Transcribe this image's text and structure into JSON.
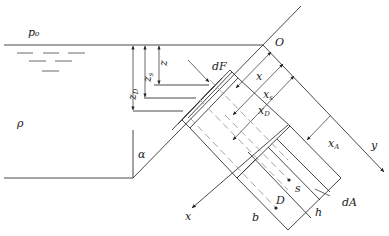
{
  "diagram": {
    "labels": {
      "p0": "p₀",
      "rho": "ρ",
      "alpha": "α",
      "origin": "O",
      "dF": "dF",
      "z": "z",
      "zs": "z",
      "zs_sub": "s",
      "zD": "z",
      "zD_sub": "D",
      "x": "x",
      "xs": "x",
      "xs_sub": "s",
      "xD": "x",
      "xD_sub": "D",
      "xA": "x",
      "xA_sub": "A",
      "y_axis": "y",
      "x_axis": "x",
      "s_point": "s",
      "D_point": "D",
      "b": "b",
      "h": "h",
      "dA": "dA"
    },
    "colors": {
      "line": "#333333",
      "dashed": "#999999",
      "text": "#222222"
    }
  }
}
